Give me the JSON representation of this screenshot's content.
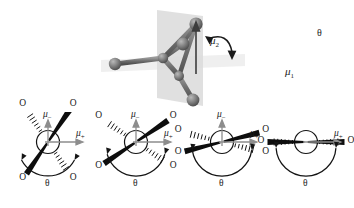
{
  "figure": {
    "type": "scientific-diagram",
    "background_color": "#ffffff"
  },
  "top_panel": {
    "name": "three-dimensional-ball-and-stick-model",
    "description": "ball-and-stick molecule straddling a translucent gray mirror plane",
    "plane_color": "#d7d7d7",
    "atom_color": "#6b6b6b",
    "bond_color": "#777777",
    "labels": {
      "mu2": "μ",
      "mu2_sub": "2",
      "mu1": "μ",
      "mu1_sub": "1",
      "theta": "θ"
    }
  },
  "bottom_row": {
    "name": "newman-projection-series",
    "panels": [
      {
        "id": "panel-1",
        "theta_label": "θ",
        "theta_degrees": 60,
        "mu_minus_label": "μ",
        "mu_minus_sub": "−",
        "mu_plus_label": "μ",
        "mu_plus_sub": "+",
        "show_mu_minus": true,
        "oxygen_labels": [
          "O",
          "O",
          "O",
          "O"
        ],
        "front_bond_angle_deg": -56,
        "back_bond_angle_deg": -124,
        "arc_start_deg": 208,
        "arc_end_deg": 332
      },
      {
        "id": "panel-2",
        "theta_label": "θ",
        "theta_degrees": 100,
        "mu_minus_label": "μ",
        "mu_minus_sub": "−",
        "mu_plus_label": "μ",
        "mu_plus_sub": "+",
        "show_mu_minus": true,
        "oxygen_labels": [
          "O",
          "O",
          "O",
          "O"
        ],
        "front_bond_angle_deg": -34,
        "back_bond_angle_deg": -146,
        "arc_start_deg": 196,
        "arc_end_deg": 344
      },
      {
        "id": "panel-3",
        "theta_label": "θ",
        "theta_degrees": 145,
        "mu_minus_label": "μ",
        "mu_minus_sub": "−",
        "mu_plus_label": "μ",
        "mu_plus_sub": "+",
        "show_mu_minus": true,
        "oxygen_labels": [
          "O",
          "O",
          "O",
          "O"
        ],
        "front_bond_angle_deg": -14,
        "back_bond_angle_deg": -166,
        "arc_start_deg": 188,
        "arc_end_deg": 352
      },
      {
        "id": "panel-4",
        "theta_label": "θ",
        "theta_degrees": 180,
        "mu_minus_label": "μ",
        "mu_minus_sub": "−",
        "mu_plus_label": "μ",
        "mu_plus_sub": "+",
        "show_mu_minus": false,
        "oxygen_labels": [
          "O",
          "O"
        ],
        "front_bond_angle_deg": 0,
        "back_bond_angle_deg": 180,
        "arc_start_deg": 184,
        "arc_end_deg": 356
      }
    ]
  },
  "colors": {
    "ink": "#1a1a1a",
    "bond_black": "#111111",
    "arrow_gray": "#8a8a8a",
    "plane_gray": "#d7d7d7",
    "sphere_gray": "#6f6f6f"
  }
}
